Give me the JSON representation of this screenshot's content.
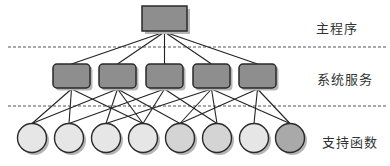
{
  "diagram": {
    "type": "hierarchy",
    "colors": {
      "box_fill": "#8e8e8e",
      "box_stroke": "#2a2a2a",
      "shadow": "#b5b5b5",
      "line": "#222222",
      "dash": "#555555",
      "circle_light": "#e6e6e6",
      "circle_mid": "#d4d4d4",
      "circle_dark": "#a9a9a9"
    },
    "levels": [
      {
        "id": "main",
        "label": "主程序",
        "label_x": 316,
        "label_y": 18
      },
      {
        "id": "services",
        "label": "系统服务",
        "label_x": 317,
        "label_y": 69
      },
      {
        "id": "support",
        "label": "支持函数",
        "label_x": 322,
        "label_y": 132
      }
    ],
    "separators": [
      47,
      106
    ],
    "root": {
      "x": 142,
      "y": 6,
      "w": 45,
      "h": 25
    },
    "services": [
      {
        "x": 53,
        "y": 64,
        "w": 37,
        "h": 24
      },
      {
        "x": 99,
        "y": 64,
        "w": 37,
        "h": 24
      },
      {
        "x": 146,
        "y": 64,
        "w": 37,
        "h": 24
      },
      {
        "x": 193,
        "y": 64,
        "w": 37,
        "h": 24
      },
      {
        "x": 239,
        "y": 64,
        "w": 37,
        "h": 24
      }
    ],
    "support": [
      {
        "cx": 32,
        "cy": 138,
        "r": 14.5,
        "shade": "circle_light"
      },
      {
        "cx": 69,
        "cy": 138,
        "r": 14.5,
        "shade": "circle_light"
      },
      {
        "cx": 106,
        "cy": 138,
        "r": 14.5,
        "shade": "circle_light"
      },
      {
        "cx": 143,
        "cy": 138,
        "r": 14.5,
        "shade": "circle_light"
      },
      {
        "cx": 180,
        "cy": 138,
        "r": 14.5,
        "shade": "circle_mid"
      },
      {
        "cx": 217,
        "cy": 138,
        "r": 14.5,
        "shade": "circle_mid"
      },
      {
        "cx": 254,
        "cy": 138,
        "r": 14.5,
        "shade": "circle_light"
      },
      {
        "cx": 290,
        "cy": 138,
        "r": 14.5,
        "shade": "circle_dark"
      }
    ],
    "service_links": [
      [
        0,
        1,
        3
      ],
      [
        0,
        2,
        3,
        4
      ],
      [
        1,
        3,
        5
      ],
      [
        2,
        4,
        5,
        7
      ],
      [
        4,
        6,
        7
      ]
    ]
  }
}
